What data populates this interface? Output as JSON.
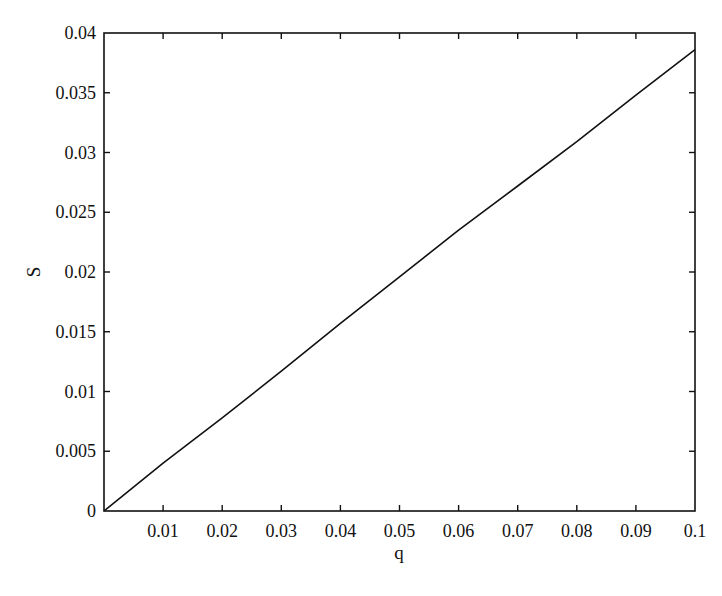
{
  "chart_data": {
    "type": "line",
    "title": "",
    "xlabel": "q",
    "ylabel": "S",
    "xlim": [
      0,
      0.1
    ],
    "ylim": [
      0,
      0.04
    ],
    "grid": false,
    "legend": null,
    "x_ticks": [
      0.01,
      0.02,
      0.03,
      0.04,
      0.05,
      0.06,
      0.07,
      0.08,
      0.09,
      0.1
    ],
    "x_tick_labels": [
      "0.01",
      "0.02",
      "0.03",
      "0.04",
      "0.05",
      "0.06",
      "0.07",
      "0.08",
      "0.09",
      "0.1"
    ],
    "y_ticks": [
      0,
      0.005,
      0.01,
      0.015,
      0.02,
      0.025,
      0.03,
      0.035,
      0.04
    ],
    "y_tick_labels": [
      "0",
      "0.005",
      "0.01",
      "0.015",
      "0.02",
      "0.025",
      "0.03",
      "0.035",
      "0.04"
    ],
    "series": [
      {
        "name": "S(q)",
        "color": "#111111",
        "x": [
          0,
          0.01,
          0.02,
          0.03,
          0.04,
          0.05,
          0.06,
          0.07,
          0.08,
          0.09,
          0.1
        ],
        "values": [
          0,
          0.004,
          0.0078,
          0.0117,
          0.0157,
          0.0196,
          0.0235,
          0.0272,
          0.0309,
          0.0348,
          0.0386
        ]
      }
    ]
  },
  "plot": {
    "left": 104,
    "top": 33,
    "right": 695,
    "bottom": 511,
    "line_color": "#111111",
    "axis_color": "#111111"
  }
}
